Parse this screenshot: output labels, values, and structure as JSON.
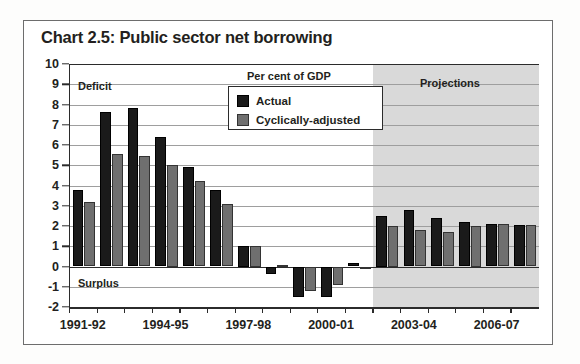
{
  "title": "Chart 2.5: Public sector net borrowing",
  "annotations": {
    "deficit": "Deficit",
    "surplus": "Surplus",
    "units": "Per cent of GDP",
    "projections": "Projections"
  },
  "legend": {
    "items": [
      {
        "label": "Actual",
        "color": "#1a1a1a"
      },
      {
        "label": "Cyclically-adjusted",
        "color": "#6f6f6f"
      }
    ]
  },
  "chart_data": {
    "type": "bar",
    "title": "Chart 2.5: Public sector net borrowing",
    "subtitle": "Per cent of GDP",
    "xlabel": "",
    "ylabel": "Per cent of GDP",
    "ylim": [
      -2,
      10
    ],
    "ytick_values": [
      10,
      9,
      8,
      7,
      6,
      5,
      4,
      3,
      2,
      1,
      0,
      -1,
      -2
    ],
    "ytick_labels": [
      "10",
      "9",
      "8",
      "7",
      "6",
      "5",
      "4",
      "3",
      "2",
      "1",
      "0",
      "-1",
      "-2"
    ],
    "grid": true,
    "legend_position": "top-center",
    "categories": [
      "1991-92",
      "1992-93",
      "1993-94",
      "1994-95",
      "1995-96",
      "1996-97",
      "1997-98",
      "1998-99",
      "1999-00",
      "2000-01",
      "2001-02",
      "2002-03",
      "2003-04",
      "2004-05",
      "2005-06",
      "2006-07",
      "2007-08"
    ],
    "xtick_labels": [
      "1991-92",
      "1994-95",
      "1997-98",
      "2000-01",
      "2003-04",
      "2006-07"
    ],
    "xtick_category_indices": [
      0,
      3,
      6,
      9,
      12,
      15
    ],
    "series": [
      {
        "name": "Actual",
        "color": "#1a1a1a",
        "values": [
          3.8,
          7.65,
          7.85,
          6.4,
          4.9,
          3.8,
          1.0,
          -0.35,
          -1.5,
          -1.5,
          0.15,
          2.5,
          2.8,
          2.4,
          2.2,
          2.1,
          2.05
        ]
      },
      {
        "name": "Cyclically-adjusted",
        "color": "#6f6f6f",
        "values": [
          3.2,
          5.55,
          5.45,
          5.0,
          4.2,
          3.1,
          1.0,
          0.05,
          -1.2,
          -0.9,
          0.0,
          2.0,
          1.8,
          1.7,
          2.0,
          2.1,
          2.05
        ]
      }
    ],
    "shaded_region": {
      "label": "Projections",
      "from_category": "2002-03",
      "to_category": "2007-08",
      "color": "#d9d9d9"
    },
    "zero_line": 0,
    "above_zero_label": "Deficit",
    "below_zero_label": "Surplus"
  }
}
